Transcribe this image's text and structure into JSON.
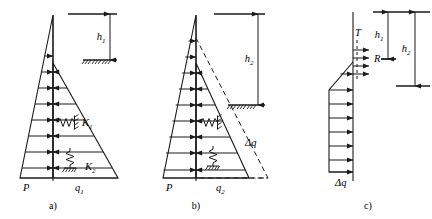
{
  "figure": {
    "width": 432,
    "height": 219,
    "background": "#ffffff",
    "stroke": "#1a1a1a"
  },
  "panels": [
    {
      "id": "a",
      "caption": "a)",
      "labels": {
        "height_dim": "h",
        "height_dim_sub": "1",
        "left_load": "P",
        "right_load": "q",
        "right_load_sub": "1",
        "spring_upper": "K",
        "spring_upper_sub": "1",
        "spring_lower": "K",
        "spring_lower_sub": "2"
      }
    },
    {
      "id": "b",
      "caption": "b)",
      "labels": {
        "height_dim": "h",
        "height_dim_sub": "2",
        "left_load": "P",
        "right_load": "q",
        "right_load_sub": "2",
        "delta_load": "Δq"
      }
    },
    {
      "id": "c",
      "caption": "c)",
      "labels": {
        "force_top": "T",
        "force_mid": "R",
        "height_inner": "h",
        "height_inner_sub": "1",
        "height_outer": "h",
        "height_outer_sub": "2",
        "delta_load": "Δq"
      }
    }
  ]
}
